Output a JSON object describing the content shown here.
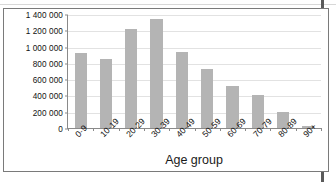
{
  "figure": {
    "ylabel": "Number of people",
    "xlabel": "Age group"
  },
  "yaxis": {
    "ticks": [
      {
        "label": "0",
        "value": 0
      },
      {
        "label": "200 000",
        "value": 200000
      },
      {
        "label": "400 000",
        "value": 400000
      },
      {
        "label": "600 000",
        "value": 600000
      },
      {
        "label": "800 000",
        "value": 800000
      },
      {
        "label": "1 000 000",
        "value": 1000000
      },
      {
        "label": "1 200 000",
        "value": 1200000
      },
      {
        "label": "1 400 000",
        "value": 1400000
      }
    ]
  },
  "chart_data": {
    "type": "bar",
    "title": "",
    "xlabel": "Age group",
    "ylabel": "Number of people",
    "categories": [
      "0-9",
      "10-19",
      "20-29",
      "30-39",
      "40-49",
      "50-59",
      "60-69",
      "70-79",
      "80-89",
      "90+"
    ],
    "values": [
      920000,
      845000,
      1215000,
      1335000,
      930000,
      730000,
      520000,
      400000,
      200000,
      25000
    ],
    "ylim": [
      0,
      1400000
    ],
    "ytick_labels": [
      "0",
      "200 000",
      "400 000",
      "600 000",
      "800 000",
      "1 000 000",
      "1 200 000",
      "1 400 000"
    ],
    "ytick_values": [
      0,
      200000,
      400000,
      600000,
      800000,
      1000000,
      1200000,
      1400000
    ],
    "grid": true,
    "legend": "none",
    "series": [
      {
        "name": "Number of people",
        "values": [
          920000,
          845000,
          1215000,
          1335000,
          930000,
          730000,
          520000,
          400000,
          200000,
          25000
        ]
      }
    ]
  },
  "colors": {
    "bar": "#b4b4b4",
    "gridline": "#e2e2e2",
    "axis": "#8a8a8a",
    "frame": "#7a7a7a",
    "text": "#111111"
  }
}
